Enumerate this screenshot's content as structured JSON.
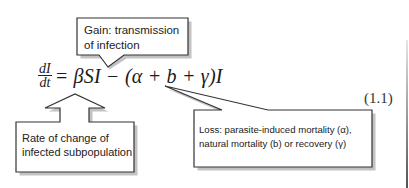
{
  "equation": {
    "lhs_numerator": "dI",
    "lhs_denominator": "dt",
    "rhs": "= βSI − (α + b + γ)I",
    "number": "(1.1)"
  },
  "callouts": {
    "gain": {
      "text": "Gain: transmission of infection"
    },
    "rate": {
      "text": "Rate of change of infected subpopulation"
    },
    "loss": {
      "line1": "Loss: parasite-induced mortality (α),",
      "line2": "natural mortality (b) or recovery (γ)"
    }
  },
  "colors": {
    "stroke": "#333333",
    "shadow": "#555555",
    "background": "#ffffff"
  }
}
